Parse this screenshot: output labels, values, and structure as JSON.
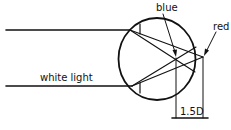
{
  "labels": {
    "blue": "blue",
    "red": "red",
    "white_light": "white light",
    "distance": "1.5D"
  },
  "colors": {
    "stroke": "#111111",
    "background": "#ffffff"
  }
}
